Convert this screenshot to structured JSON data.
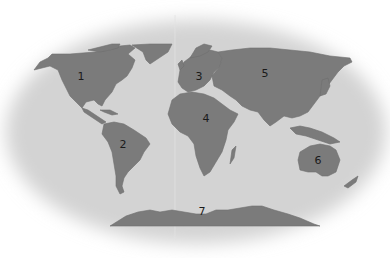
{
  "map": {
    "type": "world-continents-numbered",
    "colors": {
      "ocean": "#d3d3d3",
      "land": "#7b7b7b",
      "background": "#ffffff",
      "label": "#1a1a1a"
    },
    "labels": [
      {
        "id": "1",
        "text": "1",
        "region": "North America",
        "x": 81,
        "y": 76
      },
      {
        "id": "2",
        "text": "2",
        "region": "South America",
        "x": 123,
        "y": 144
      },
      {
        "id": "3",
        "text": "3",
        "region": "Europe",
        "x": 199,
        "y": 76
      },
      {
        "id": "4",
        "text": "4",
        "region": "Africa",
        "x": 206,
        "y": 118
      },
      {
        "id": "5",
        "text": "5",
        "region": "Asia",
        "x": 265,
        "y": 73
      },
      {
        "id": "6",
        "text": "6",
        "region": "Australia",
        "x": 318,
        "y": 160
      },
      {
        "id": "7",
        "text": "7",
        "region": "Antarctica",
        "x": 202,
        "y": 211
      }
    ]
  }
}
